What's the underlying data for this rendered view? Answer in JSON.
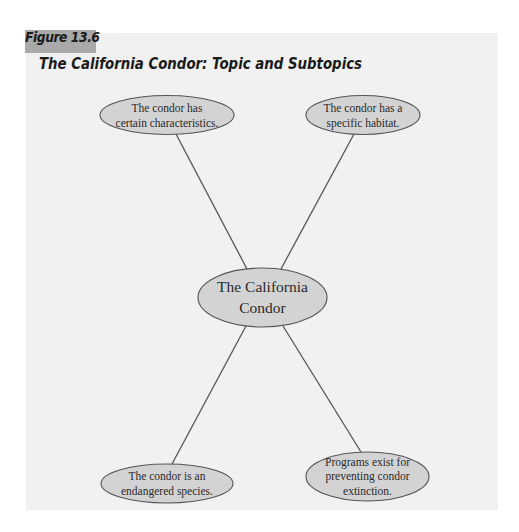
{
  "figure": {
    "label": "Figure 13.6",
    "title": "The California Condor: Topic and Subtopics"
  },
  "colors": {
    "figure_label_bg": "#a9a9a9",
    "panel_bg": "#f1f1f1",
    "node_fill": "#d3d3d3",
    "node_stroke": "#555555",
    "connector": "#555555"
  },
  "diagram": {
    "type": "topic-subtopic cluster",
    "central_topic": {
      "line1": "The California",
      "line2": "Condor"
    },
    "subtopics": [
      {
        "position": "top-left",
        "line1": "The condor has",
        "line2": "certain characteristics.",
        "line3": ""
      },
      {
        "position": "top-right",
        "line1": "The condor has a",
        "line2": "specific habitat.",
        "line3": ""
      },
      {
        "position": "bottom-left",
        "line1": "The condor is an",
        "line2": "endangered species.",
        "line3": ""
      },
      {
        "position": "bottom-right",
        "line1": "Programs exist for",
        "line2": "preventing condor",
        "line3": "extinction."
      }
    ]
  }
}
